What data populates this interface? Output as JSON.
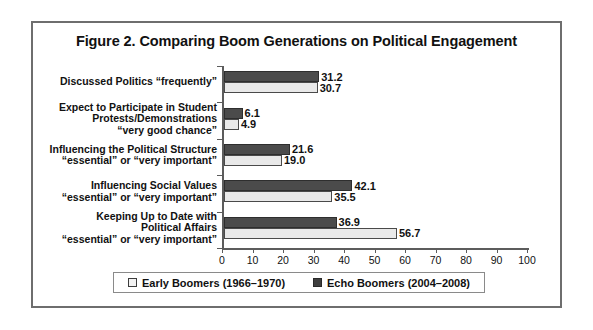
{
  "figure": {
    "title": "Figure 2. Comparing Boom Generations on Political Engagement"
  },
  "colors": {
    "early_boomers": "#e9e9e9",
    "echo_boomers": "#4b4b4b",
    "axis": "#5c5c5c",
    "frame": "#6e6e6e",
    "text": "#111111"
  },
  "chart_data": {
    "type": "bar",
    "orientation": "horizontal",
    "title": "Figure 2. Comparing Boom Generations on Political Engagement",
    "xlabel": "",
    "ylabel": "",
    "xlim": [
      0,
      100
    ],
    "xticks": [
      0,
      10,
      20,
      30,
      40,
      50,
      60,
      70,
      80,
      90,
      100
    ],
    "grid": false,
    "legend_position": "bottom",
    "categories": [
      "Discussed Politics “frequently”",
      "Expect to Participate in Student Protests/Demonstrations “very good chance”",
      "Influencing the Political Structure “essential” or “very important”",
      "Influencing Social Values “essential” or “very important”",
      "Keeping Up to Date with Political Affairs “essential” or “very important”"
    ],
    "category_lines": [
      [
        "Discussed Politics “frequently”"
      ],
      [
        "Expect to Participate in Student",
        "Protests/Demonstrations",
        "“very good chance”"
      ],
      [
        "Influencing the Political Structure",
        "“essential” or “very important”"
      ],
      [
        "Influencing Social Values",
        "“essential” or “very important”"
      ],
      [
        "Keeping Up to Date with",
        "Political Affairs",
        "“essential” or “very important”"
      ]
    ],
    "series": [
      {
        "name": "Echo Boomers (2004–2008)",
        "key": "echo",
        "values": [
          31.2,
          6.1,
          21.6,
          42.1,
          36.9
        ],
        "labels": [
          "31.2",
          "6.1",
          "21.6",
          "42.1",
          "36.9"
        ],
        "color": "#4b4b4b"
      },
      {
        "name": "Early Boomers (1966–1970)",
        "key": "early",
        "values": [
          30.7,
          4.9,
          19.0,
          35.5,
          56.7
        ],
        "labels": [
          "30.7",
          "4.9",
          "19.0",
          "35.5",
          "56.7"
        ],
        "color": "#e9e9e9"
      }
    ]
  },
  "xaxis": {
    "tick_labels": [
      "0",
      "10",
      "20",
      "30",
      "40",
      "50",
      "60",
      "70",
      "80",
      "90",
      "100"
    ]
  },
  "legend": {
    "items": [
      {
        "label": "Early Boomers (1966–1970)",
        "swatch": "light"
      },
      {
        "label": "Echo Boomers (2004–2008)",
        "swatch": "dark"
      }
    ]
  }
}
